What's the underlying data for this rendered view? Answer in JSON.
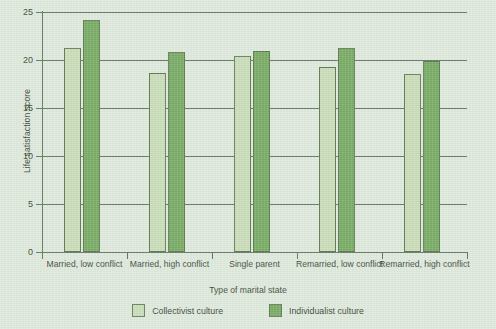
{
  "chart_data": {
    "type": "bar",
    "title": "",
    "xlabel": "Type of marital state",
    "ylabel": "Life satisfaction score",
    "ylim": [
      0,
      25
    ],
    "yticks": [
      0,
      5,
      10,
      15,
      20,
      25
    ],
    "ytick_labels": [
      "0",
      "5",
      "10",
      "15",
      "20",
      "25"
    ],
    "grid": true,
    "legend_position": "bottom",
    "categories": [
      "Married, low conflict",
      "Married, high conflict",
      "Single parent",
      "Remarried, low conflict",
      "Remarried, high conflict"
    ],
    "series": [
      {
        "name": "Collectivist culture",
        "color": "#c9ddb9",
        "values": [
          21.3,
          18.6,
          20.4,
          19.3,
          18.5
        ]
      },
      {
        "name": "Individualist culture",
        "color": "#77ab64",
        "values": [
          24.2,
          20.8,
          20.9,
          21.3,
          19.9
        ]
      }
    ]
  },
  "colors": {
    "background": "#dfe9dc",
    "axis": "#5d6f5d",
    "bar_border": "#5e7a50",
    "collectivist": "#c9ddb9",
    "individualist": "#77ab64"
  }
}
